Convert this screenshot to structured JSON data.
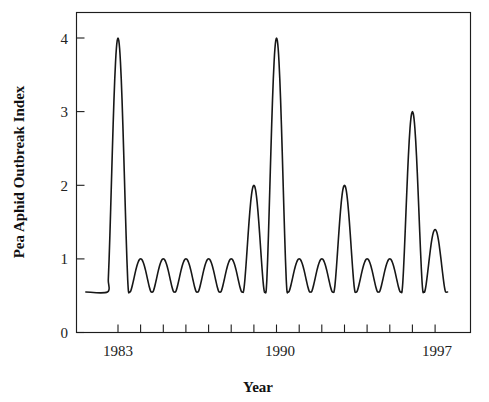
{
  "figure": {
    "name": "pea-aphid-outbreak-index-time-series",
    "background_color": "#ffffff",
    "line_color": "#171717",
    "axis_color": "#1d1d1d"
  },
  "axes": {
    "y_title": "Pea Aphid Outbreak Index",
    "x_title": "Year",
    "y_ticks": [
      "0",
      "1",
      "2",
      "3",
      "4"
    ],
    "x_ticks": [
      "1983",
      "1990",
      "1997"
    ]
  },
  "chart_data": {
    "type": "line",
    "title": "",
    "subtitle": "",
    "xlabel": "Year",
    "ylabel": "Pea Aphid Outbreak Index",
    "xlim": [
      1981.6,
      1997.8
    ],
    "ylim": [
      0,
      4.25
    ],
    "y_ticks": [
      0,
      1,
      2,
      3,
      4
    ],
    "x_ticks": [
      1983,
      1990,
      1997
    ],
    "x_minor_tick_interval": 1,
    "x_minor_ticks": [
      1983,
      1984,
      1985,
      1986,
      1987,
      1988,
      1989,
      1990,
      1991,
      1992,
      1993,
      1994,
      1995,
      1996,
      1997
    ],
    "grid": false,
    "legend": null,
    "legend_position": "none",
    "baseline_value": 0.55,
    "series": [
      {
        "name": "Pea Aphid Outbreak Index",
        "color": "#171717",
        "x": [
          1982,
          1983,
          1984,
          1985,
          1986,
          1987,
          1988,
          1989,
          1990,
          1991,
          1992,
          1993,
          1994,
          1995,
          1996,
          1997
        ],
        "values": [
          0.55,
          4.0,
          1.0,
          1.0,
          1.0,
          1.0,
          1.0,
          2.0,
          4.0,
          1.0,
          1.0,
          2.0,
          1.0,
          1.0,
          3.0,
          1.4
        ]
      }
    ],
    "annotations": []
  }
}
